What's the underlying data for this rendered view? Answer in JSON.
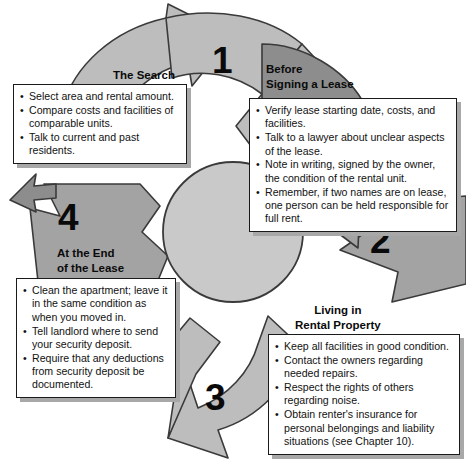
{
  "diagram": {
    "colors": {
      "arrow_light": "#bdbdbd",
      "arrow_medium": "#a3a3a3",
      "arrow_dark": "#8d8d8d",
      "circle_fill": "#c9c9c9",
      "outline": "#3a3a3a",
      "box_fill": "#ffffff",
      "box_border": "#1a1a1a",
      "shadow": "#a8a8a8",
      "text": "#111111"
    },
    "stages": [
      {
        "number": "1",
        "heading": "The Search",
        "items": [
          "Select area and rental amount.",
          "Compare costs and facilities of comparable units.",
          "Talk to current and past residents."
        ]
      },
      {
        "number": "2",
        "heading": "Before\nSigning a Lease",
        "items": [
          "Verify lease starting date, costs, and facilities.",
          "Talk to a lawyer about unclear aspects of the lease.",
          "Note in writing, signed by the owner, the condition of the rental unit.",
          "Remember, if two names are on lease, one person can be held responsible for full rent."
        ]
      },
      {
        "number": "3",
        "heading": "Living in\nRental Property",
        "items": [
          "Keep all facilities in good condition.",
          "Contact the owners regarding needed repairs.",
          "Respect the rights of others regarding noise.",
          "Obtain renter's insurance for personal belongings and liability situations (see Chapter 10)."
        ]
      },
      {
        "number": "4",
        "heading": "At the End\nof the Lease",
        "items": [
          "Clean the apartment; leave it in the same condition as when you moved in.",
          "Tell landlord where to send your security deposit.",
          "Require that any deductions from security deposit be documented."
        ]
      }
    ]
  }
}
